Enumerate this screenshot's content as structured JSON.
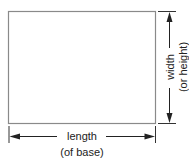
{
  "diagram": {
    "shape": "rectangle",
    "labels": {
      "length_line1": "length",
      "length_line2": "(of base)",
      "width_line1": "width",
      "width_line2": "(or height)"
    },
    "colors": {
      "stroke": "#8a8a8a",
      "arrow": "#222222",
      "text": "#222222"
    }
  }
}
